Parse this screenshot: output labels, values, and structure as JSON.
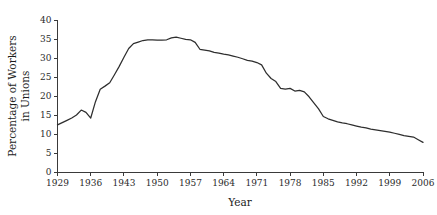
{
  "chart_data": {
    "type": "line",
    "title": "",
    "xlabel": "Year",
    "ylabel": "Percentage of Workers in Unions",
    "ylabel_line1": "Percentage of Workers",
    "ylabel_line2": "in Unions",
    "xlim": [
      1929,
      2006
    ],
    "ylim": [
      0,
      40
    ],
    "grid": false,
    "legend": false,
    "xticks": [
      1929,
      1936,
      1943,
      1950,
      1957,
      1964,
      1971,
      1978,
      1985,
      1992,
      1999,
      2006
    ],
    "yticks": [
      0,
      5,
      10,
      15,
      20,
      25,
      30,
      35,
      40
    ],
    "xtick_labels": [
      "1929",
      "1936",
      "1943",
      "1950",
      "1957",
      "1964",
      "1971",
      "1978",
      "1985",
      "1992",
      "1999",
      "2006"
    ],
    "ytick_labels": [
      "0",
      "5",
      "10",
      "15",
      "20",
      "25",
      "30",
      "35",
      "40"
    ],
    "line_color": "#2e2e2e",
    "background_color": "#ffffff",
    "x": [
      1929,
      1930,
      1931,
      1932,
      1933,
      1934,
      1935,
      1936,
      1937,
      1938,
      1939,
      1940,
      1941,
      1942,
      1943,
      1944,
      1945,
      1946,
      1947,
      1948,
      1949,
      1950,
      1951,
      1952,
      1953,
      1954,
      1955,
      1956,
      1957,
      1958,
      1959,
      1960,
      1961,
      1962,
      1963,
      1964,
      1965,
      1966,
      1967,
      1968,
      1969,
      1970,
      1971,
      1972,
      1973,
      1974,
      1975,
      1976,
      1977,
      1978,
      1979,
      1980,
      1981,
      1982,
      1983,
      1984,
      1985,
      1986,
      1987,
      1988,
      1989,
      1990,
      1991,
      1992,
      1993,
      1994,
      1995,
      1996,
      1997,
      1998,
      1999,
      2000,
      2001,
      2002,
      2003,
      2004,
      2005,
      2006
    ],
    "y": [
      12.4,
      13.0,
      13.6,
      14.2,
      15.0,
      16.3,
      15.7,
      14.2,
      18.5,
      21.8,
      22.6,
      23.5,
      25.6,
      27.8,
      30.2,
      32.5,
      33.8,
      34.2,
      34.6,
      34.8,
      34.8,
      34.7,
      34.7,
      34.8,
      35.3,
      35.5,
      35.2,
      34.9,
      34.8,
      34.1,
      32.3,
      32.1,
      31.9,
      31.5,
      31.3,
      31.0,
      30.8,
      30.5,
      30.2,
      29.8,
      29.4,
      29.2,
      28.8,
      28.2,
      26.0,
      24.6,
      23.8,
      22.0,
      21.8,
      22.0,
      21.3,
      21.5,
      21.1,
      19.8,
      18.2,
      16.6,
      14.6,
      14.0,
      13.6,
      13.2,
      12.9,
      12.7,
      12.4,
      12.1,
      11.8,
      11.6,
      11.3,
      11.1,
      10.9,
      10.7,
      10.5,
      10.2,
      9.9,
      9.6,
      9.4,
      9.2,
      8.5,
      7.8
    ]
  },
  "axes": {
    "x_title": "Year",
    "y_title_line1": "Percentage of Workers",
    "y_title_line2": "in Unions"
  }
}
